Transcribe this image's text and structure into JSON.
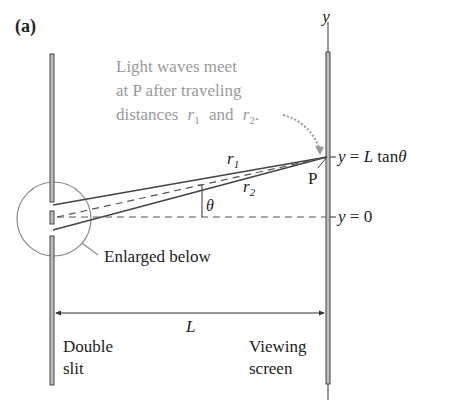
{
  "figure": {
    "panel_label": "(a)",
    "caption_lines": [
      "Light waves meet",
      "at P after traveling",
      "distances"
    ],
    "caption_r1": "r",
    "caption_r1_sub": "1",
    "caption_and": "and",
    "caption_r2": "r",
    "caption_r2_sub": "2",
    "caption_period": ".",
    "axis_label": "y",
    "point_label": "P",
    "ray1_label": "r",
    "ray1_sub": "1",
    "ray2_label": "r",
    "ray2_sub": "2",
    "angle_label": "θ",
    "y_top_label": "y = L tanθ",
    "y_zero_label": "y = 0",
    "enlarged_label": "Enlarged below",
    "distance_label": "L",
    "double_slit_lines": [
      "Double",
      "slit"
    ],
    "screen_lines": [
      "Viewing",
      "screen"
    ]
  },
  "colors": {
    "ink": "#333333",
    "caption": "#999999",
    "circle": "#888888",
    "barrier_fill": "#bdbdbd"
  }
}
